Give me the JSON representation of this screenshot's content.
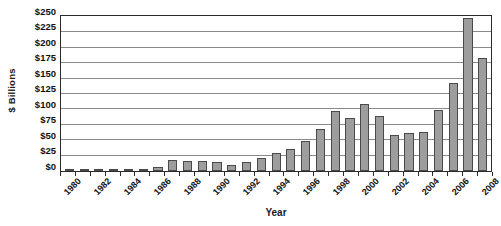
{
  "chart_data": {
    "type": "bar",
    "title": "",
    "xlabel": "Year",
    "ylabel": "$ Billions",
    "categories": [
      "1980",
      "1981",
      "1982",
      "1983",
      "1984",
      "1985",
      "1986",
      "1987",
      "1988",
      "1989",
      "1990",
      "1991",
      "1992",
      "1993",
      "1994",
      "1995",
      "1996",
      "1997",
      "1998",
      "1999",
      "2000",
      "2001",
      "2002",
      "2003",
      "2004",
      "2005",
      "2006",
      "2007",
      "2008"
    ],
    "values": [
      1,
      1,
      1.5,
      2,
      3,
      3,
      6,
      18,
      17,
      16,
      14,
      9,
      15,
      21,
      29,
      35,
      48,
      68,
      98,
      86,
      108,
      90,
      59,
      62,
      63,
      99,
      143,
      248,
      184
    ],
    "ylim": [
      0,
      250
    ],
    "ytick_values": [
      0,
      25,
      50,
      75,
      100,
      125,
      150,
      175,
      200,
      225,
      250
    ],
    "ytick_labels": [
      "$0",
      "$25",
      "$50",
      "$75",
      "$100",
      "$125",
      "$150",
      "$175",
      "$200",
      "$225",
      "$250"
    ],
    "xtick_labels": [
      "1980",
      "1982",
      "1984",
      "1986",
      "1988",
      "1990",
      "1992",
      "1994",
      "1996",
      "1998",
      "2000",
      "2002",
      "2004",
      "2006",
      "2008"
    ],
    "grid": true,
    "legend": false,
    "bar_color": "#9d9d9d",
    "bar_border_color": "#4a4a4a",
    "gridline_color": "#8a8a8a",
    "axis_color": "#2b2b2b"
  }
}
